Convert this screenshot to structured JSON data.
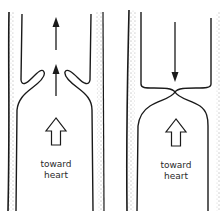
{
  "diagram": {
    "panels": [
      {
        "id": "open-valve",
        "label_line1": "toward",
        "label_line2": "heart",
        "flow_arrows": [
          "up",
          "up"
        ],
        "valve_state": "open"
      },
      {
        "id": "closed-valve",
        "label_line1": "toward",
        "label_line2": "heart",
        "flow_arrows": [
          "down"
        ],
        "valve_state": "closed"
      }
    ],
    "colors": {
      "ink": "#1a1a1a",
      "background": "#ffffff"
    }
  }
}
